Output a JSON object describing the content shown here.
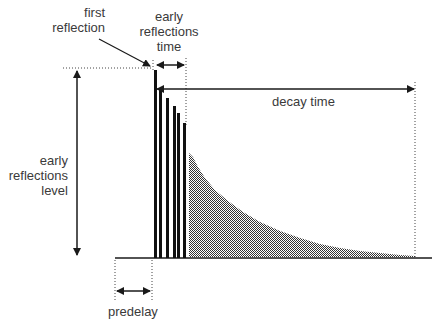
{
  "diagram": {
    "labels": {
      "first_reflection": [
        "first",
        "reflection"
      ],
      "early_reflections_time": [
        "early",
        "reflections",
        "time"
      ],
      "decay_time": "decay time",
      "early_reflections_level": [
        "early",
        "reflections",
        "level"
      ],
      "predelay": "predelay"
    },
    "colors": {
      "ink": "#1a1a1a",
      "text": "#3a3a3a",
      "decay_fill": "#777777"
    },
    "early_reflection_bars": [
      {
        "x": 155,
        "top": 70
      },
      {
        "x": 160,
        "top": 88
      },
      {
        "x": 167,
        "top": 98
      },
      {
        "x": 174,
        "top": 106
      },
      {
        "x": 178,
        "top": 113
      },
      {
        "x": 184,
        "top": 123
      }
    ]
  }
}
